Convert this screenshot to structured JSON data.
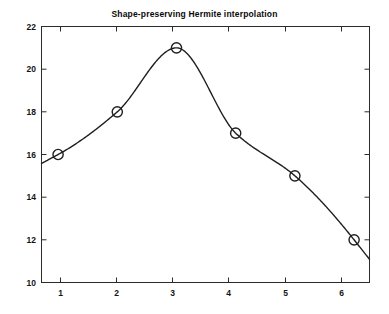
{
  "figure": {
    "background_color": "#ffffff",
    "axes_color": "#2b2b2b",
    "curve_color": "#1f1f1f",
    "marker_edge_color": "#1f1f1f",
    "marker_face_color": "none"
  },
  "chart_data": {
    "type": "line",
    "title": "Shape-preserving Hermite interpolation",
    "xlabel": "",
    "ylabel": "",
    "x": [
      1,
      2,
      3,
      4,
      5,
      6
    ],
    "values": [
      16,
      18,
      21,
      17,
      15,
      12
    ],
    "series": [
      {
        "name": "Hermite interpolant",
        "marker": "circle-open",
        "line_style": "solid",
        "x": [
          1,
          2,
          3,
          4,
          5,
          6
        ],
        "values": [
          16,
          18,
          21,
          17,
          15,
          12
        ]
      }
    ],
    "xlim": [
      0.72,
      6.26
    ],
    "ylim": [
      10,
      22
    ],
    "xticks": [
      1,
      2,
      3,
      4,
      5,
      6
    ],
    "yticks": [
      10,
      12,
      14,
      16,
      18,
      20,
      22
    ],
    "xticklabels": [
      "1",
      "2",
      "3",
      "4",
      "5",
      "6"
    ],
    "yticklabels": [
      "10",
      "12",
      "14",
      "16",
      "18",
      "20",
      "22"
    ],
    "grid": false,
    "legend": null,
    "box": true,
    "tick_direction": "in",
    "curve_extends_beyond_endpoints": true,
    "curve_start_value": 15.75,
    "curve_end_value": 10.95,
    "interpolation": "pchip",
    "peak": {
      "x": 3,
      "y": 21
    }
  }
}
